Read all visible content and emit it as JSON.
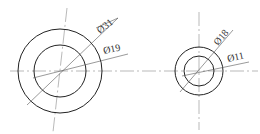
{
  "drawing": {
    "views": [
      {
        "id": "left",
        "center": [
          60,
          71
        ],
        "outer_radius": 42,
        "inner_radius": 26,
        "outer_label": "Ø31",
        "inner_label": "Ø19"
      },
      {
        "id": "right",
        "center": [
          199,
          71
        ],
        "outer_radius": 24,
        "inner_radius": 15,
        "outer_label": "Ø18",
        "inner_label": "Ø11"
      }
    ],
    "line_color": "#222222",
    "centerline_color": "#8a8a8a"
  }
}
